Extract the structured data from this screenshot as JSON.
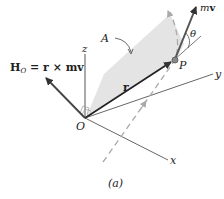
{
  "figure": {
    "caption": "(a)",
    "labels": {
      "z_axis": "z",
      "y_axis": "y",
      "x_axis": "x",
      "origin": "O",
      "point": "P",
      "plane": "A",
      "angle": "θ",
      "position_vector": "r",
      "momentum_vector_m": "m",
      "momentum_vector_v": "v",
      "angular_momentum_H": "H",
      "angular_momentum_sub": "O",
      "angular_momentum_rhs": "= r × m",
      "angular_momentum_v": "v"
    },
    "colors": {
      "plane_fill": "#e4e4e4",
      "axis": "#555555",
      "vector": "#333333",
      "dashed_path": "#aaaaaa"
    }
  }
}
